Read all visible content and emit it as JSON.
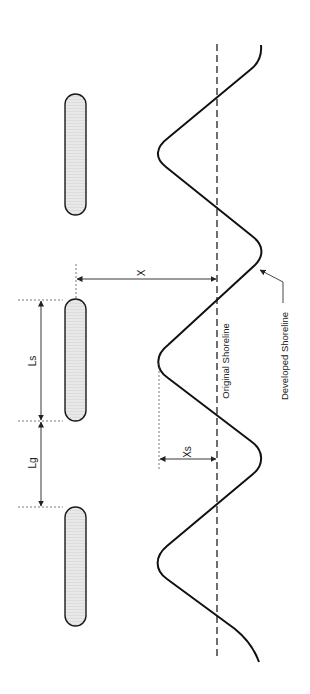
{
  "diagram": {
    "labels": {
      "x": "X",
      "xs": "Xs",
      "ls": "Ls",
      "lg": "Lg",
      "original_shoreline": "Original Shoreline",
      "developed_shoreline": "Developed Shoreline"
    },
    "colors": {
      "breakwater_fill": "#e6e6e6",
      "stroke": "#1a1a1a",
      "dimension": "#333333",
      "background": "#ffffff"
    },
    "breakwaters": [
      {
        "name": "breakwater-1",
        "x": 65,
        "y": 94,
        "width": 21,
        "height": 121
      },
      {
        "name": "breakwater-2",
        "x": 65,
        "y": 299,
        "width": 21,
        "height": 122
      },
      {
        "name": "breakwater-3",
        "x": 65,
        "y": 507,
        "width": 21,
        "height": 119
      }
    ],
    "dimensions": {
      "X": "distance from breakwater to original shoreline",
      "Xs": "salient amplitude from original shoreline",
      "Ls": "breakwater segment length",
      "Lg": "gap length between breakwaters"
    }
  }
}
